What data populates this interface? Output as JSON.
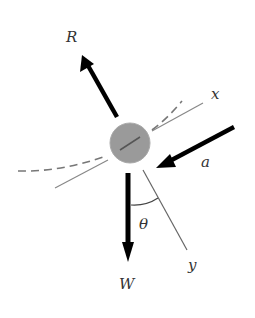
{
  "diagram": {
    "type": "free-body-diagram",
    "colors": {
      "background": "#ffffff",
      "body_fill": "#9a9a9a",
      "body_stroke": "#aaaaaa",
      "force_arrow": "#000000",
      "axis_line": "#888888",
      "dashed_path": "#777777",
      "label": "#333333"
    },
    "body": {
      "shape": "circle",
      "cx": 130,
      "cy": 143,
      "r": 20
    },
    "forces": [
      {
        "id": "R",
        "label": "R",
        "from": [
          117,
          117
        ],
        "to": [
          82,
          55
        ]
      },
      {
        "id": "a",
        "label": "a",
        "from": [
          234,
          127
        ],
        "to": [
          156,
          168
        ]
      },
      {
        "id": "W",
        "label": "W",
        "from": [
          128,
          173
        ],
        "to": [
          128,
          262
        ]
      }
    ],
    "axes": [
      {
        "id": "x",
        "label": "x",
        "from": [
          152,
          131
        ],
        "to": [
          203,
          103
        ]
      },
      {
        "id": "y",
        "label": "y",
        "from": [
          143,
          170
        ],
        "to": [
          187,
          250
        ]
      }
    ],
    "angle": {
      "label": "θ",
      "between": [
        "W",
        "y"
      ]
    },
    "labels": {
      "R": "R",
      "x": "x",
      "a": "a",
      "theta": "θ",
      "W": "W",
      "y": "y"
    }
  }
}
